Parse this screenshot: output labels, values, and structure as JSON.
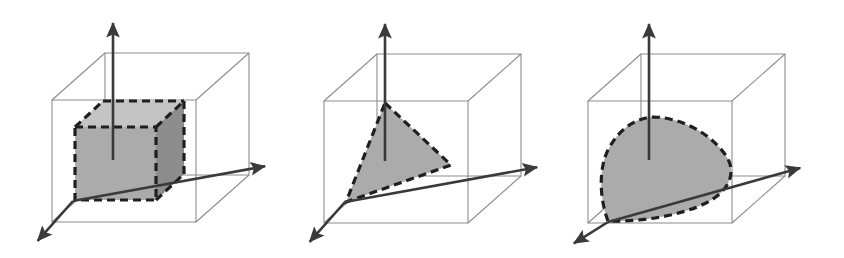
{
  "figure": {
    "title": "Three convex sets inscribed in a 3D coordinate bounding box",
    "background_color": "#ffffff",
    "width": 844,
    "height": 258,
    "panel_count": 3,
    "style": {
      "box_stroke": "#8c8c8c",
      "box_stroke_width": 1.1,
      "axis_stroke": "#3a3a3a",
      "axis_stroke_width": 2.6,
      "region_outline": "#1f1f1f",
      "region_outline_width": 3.2,
      "region_dash": "8,5",
      "fill_light": "#c4c4c4",
      "fill_mid": "#ababab",
      "fill_dark": "#8d8d8d"
    },
    "panels": [
      {
        "id": "panel-box",
        "name": "box-region-panel",
        "region_type": "box",
        "region_label": "axis-aligned box",
        "shading": "three visible faces: light top, mid front, dark right",
        "origin": [
          73,
          201
        ],
        "axes": {
          "x_axis": {
            "label": "x-axis",
            "from": [
              73,
              201
            ],
            "to": [
              272,
              165
            ],
            "arrow": true
          },
          "z_axis": {
            "label": "z-axis",
            "from": [
              113,
              160
            ],
            "to": [
              113,
              16
            ],
            "arrow": true
          },
          "y_axis": {
            "label": "y-axis",
            "from": [
              73,
              201
            ],
            "to": [
              33,
              246
            ],
            "arrow": true
          }
        },
        "bounding_box": {
          "front_top_left": [
            52,
            100
          ],
          "front_top_right": [
            196,
            100
          ],
          "front_bottom_left": [
            52,
            222
          ],
          "front_bottom_right": [
            196,
            222
          ],
          "back_top_left": [
            105,
            53
          ],
          "back_top_right": [
            249,
            53
          ],
          "back_bottom_left": [
            105,
            175
          ],
          "back_bottom_right": [
            249,
            175
          ]
        },
        "region_vertices": {
          "front_top_left": [
            75,
            127
          ],
          "front_top_right": [
            156,
            127
          ],
          "front_bottom_left": [
            75,
            200
          ],
          "front_bottom_right": [
            156,
            200
          ],
          "back_top_left": [
            103,
            101
          ],
          "back_top_right": [
            184,
            101
          ],
          "back_bottom_right": [
            184,
            174
          ]
        }
      },
      {
        "id": "panel-simplex",
        "name": "simplex-region-panel",
        "region_type": "triangle",
        "region_label": "probability simplex",
        "shading": "uniform mid gray",
        "origin": [
          345,
          202
        ],
        "axes": {
          "x_axis": {
            "label": "x-axis",
            "from": [
              345,
              202
            ],
            "to": [
              544,
              166
            ],
            "arrow": true
          },
          "z_axis": {
            "label": "z-axis",
            "from": [
              385,
              161
            ],
            "to": [
              385,
              17
            ],
            "arrow": true
          },
          "y_axis": {
            "label": "y-axis",
            "from": [
              345,
              202
            ],
            "to": [
              305,
              247
            ],
            "arrow": true
          }
        },
        "bounding_box": {
          "front_top_left": [
            324,
            101
          ],
          "front_top_right": [
            468,
            101
          ],
          "front_bottom_left": [
            324,
            223
          ],
          "front_bottom_right": [
            468,
            223
          ],
          "back_top_left": [
            377,
            54
          ],
          "back_top_right": [
            521,
            54
          ],
          "back_bottom_left": [
            377,
            176
          ],
          "back_bottom_right": [
            521,
            176
          ]
        },
        "region_vertices": [
          [
            385,
            103
          ],
          [
            451,
            165
          ],
          [
            346,
            202
          ]
        ]
      },
      {
        "id": "panel-blob",
        "name": "convex-blob-region-panel",
        "region_type": "convex-blob",
        "region_label": "smooth convex set",
        "shading": "uniform mid gray",
        "origin": [
          608,
          222
        ],
        "axes": {
          "x_axis": {
            "label": "x-axis",
            "from": [
              608,
              222
            ],
            "to": [
              807,
              166
            ],
            "arrow": true
          },
          "z_axis": {
            "label": "z-axis",
            "from": [
              649,
              160
            ],
            "to": [
              649,
              17
            ],
            "arrow": true
          },
          "y_axis": {
            "label": "y-axis",
            "from": [
              608,
              222
            ],
            "to": [
              568,
              247
            ],
            "arrow": true
          }
        },
        "bounding_box": {
          "front_top_left": [
            588,
            101
          ],
          "front_top_right": [
            732,
            101
          ],
          "front_bottom_left": [
            588,
            223
          ],
          "front_bottom_right": [
            732,
            223
          ],
          "back_top_left": [
            641,
            54
          ],
          "back_top_right": [
            785,
            54
          ],
          "back_bottom_left": [
            641,
            176
          ],
          "back_bottom_right": [
            785,
            176
          ]
        },
        "region_outline_path": "M 608,221 C 600,200 598,170 608,150 C 620,126 640,117 654,117 C 686,118 716,138 728,159 C 736,175 728,192 706,203 C 682,215 644,222 608,221 Z"
      }
    ]
  }
}
